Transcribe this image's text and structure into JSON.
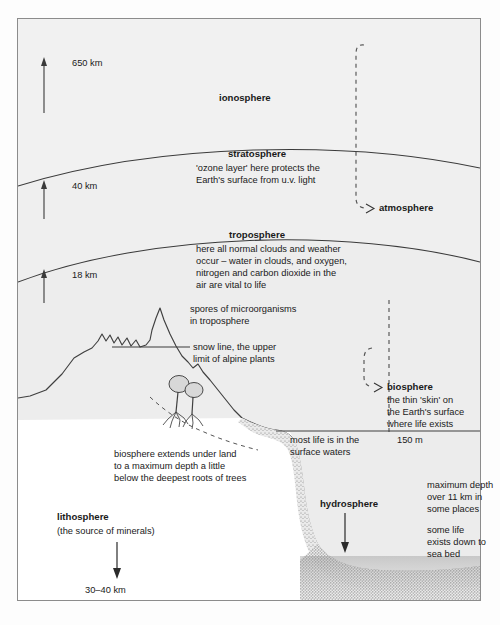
{
  "figure": {
    "number": "Figure 4.19",
    "title": "The biosphere in relation to the ozone layer"
  },
  "altitude_markers": [
    {
      "name": "ionosphere-top",
      "value": "650 km"
    },
    {
      "name": "stratosphere-top",
      "value": "40 km"
    },
    {
      "name": "troposphere-top",
      "value": "18 km"
    }
  ],
  "layers": {
    "ionosphere": {
      "label": "ionosphere",
      "description": ""
    },
    "stratosphere": {
      "label": "stratosphere",
      "line1": "'ozone layer' here protects the",
      "line2": "Earth's surface from u.v. light"
    },
    "troposphere": {
      "label": "troposphere",
      "line1": "here all normal clouds and weather",
      "line2": "occur – water in clouds, and oxygen,",
      "line3": "nitrogen and carbon dioxide in the",
      "line4": "air are vital to life"
    }
  },
  "annotations": {
    "atmosphere": {
      "label": "atmosphere"
    },
    "spores": {
      "line1": "spores of microorganisms",
      "line2": "in troposphere"
    },
    "snow_line": {
      "line1": "snow line, the upper",
      "line2": "limit of alpine plants"
    },
    "biosphere": {
      "label": "biosphere",
      "line1": "the thin 'skin' on",
      "line2": "the Earth's surface",
      "line3": "where life exists"
    },
    "under_land": {
      "line1": "biosphere extends under land",
      "line2": "to a maximum depth a little",
      "line3": "below the deepest roots of trees"
    },
    "surface_waters": {
      "line1": "most life is in the",
      "line2": "surface waters"
    },
    "depth_150m": {
      "label": "150 m"
    },
    "max_depth": {
      "line1": "maximum depth",
      "line2": "over 11 km in",
      "line3": "some places"
    },
    "sea_bed_life": {
      "line1": "some life",
      "line2": "exists down to",
      "line3": "sea bed"
    },
    "hydrosphere": {
      "label": "hydrosphere"
    },
    "lithosphere": {
      "label": "lithosphere",
      "sub": "(the source of minerals)",
      "depth": "30–40 km"
    }
  },
  "colors": {
    "frame": "#8c8c8c",
    "band_upper": "#f1f1f1",
    "band_mid": "#efefef",
    "band_lower": "#ededed",
    "water": "#ececec",
    "line": "#3a3a3a",
    "text": "#1a1a1a"
  }
}
